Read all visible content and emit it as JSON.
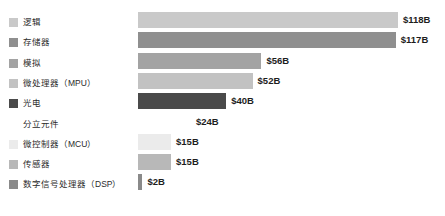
{
  "chart_data": {
    "type": "bar",
    "orientation": "horizontal",
    "title": "",
    "subtitle": "",
    "xlabel": "",
    "ylabel": "",
    "grid": false,
    "legend_position": "left",
    "value_unit": "B",
    "value_prefix": "$",
    "xlim": [
      0,
      118
    ],
    "categories": [
      "逻辑",
      "存储器",
      "模拟",
      "微处理器（MPU）",
      "光电",
      "分立元件",
      "微控制器（MCU）",
      "传感器",
      "数字信号处理器（DSP）"
    ],
    "values": [
      118,
      117,
      56,
      52,
      40,
      24,
      15,
      15,
      2
    ],
    "value_labels": [
      "$118B",
      "$117B",
      "$56B",
      "$52B",
      "$40B",
      "$24B",
      "$15B",
      "$15B",
      "$2B"
    ],
    "colors": [
      "#c9c9c9",
      "#8f8f8f",
      "#a3a3a3",
      "#c2c2c2",
      "#4a4a4a",
      "#ffffff",
      "#ebebeb",
      "#b8b8b8",
      "#8a8a8a"
    ]
  },
  "legend": {
    "items": [
      {
        "label": "逻辑",
        "color": "#c9c9c9"
      },
      {
        "label": "存储器",
        "color": "#8f8f8f"
      },
      {
        "label": "模拟",
        "color": "#a3a3a3"
      },
      {
        "label": "微处理器（MPU）",
        "color": "#c2c2c2"
      },
      {
        "label": "光电",
        "color": "#4a4a4a"
      },
      {
        "label": "分立元件",
        "color": "#ffffff"
      },
      {
        "label": "微控制器（MCU）",
        "color": "#ebebeb"
      },
      {
        "label": "传感器",
        "color": "#b8b8b8"
      },
      {
        "label": "数字信号处理器（DSP）",
        "color": "#8a8a8a"
      }
    ]
  }
}
